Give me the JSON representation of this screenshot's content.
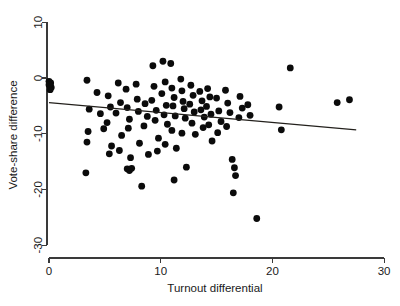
{
  "chart_data": {
    "type": "scatter",
    "title": "",
    "subtitle": "",
    "xlabel": "Turnout differential",
    "ylabel": "Vote-share difference",
    "xlim": [
      -1.2,
      31.0
    ],
    "ylim": [
      -31.5,
      11.5
    ],
    "xticks": [
      0,
      10,
      20,
      30
    ],
    "xticklabels": [
      "0",
      "10",
      "20",
      "30"
    ],
    "yticks": [
      10,
      0,
      -10,
      -20,
      -30
    ],
    "yticklabels": [
      "10",
      "0",
      "-10",
      "-20",
      "-30"
    ],
    "grid": false,
    "legend": null,
    "marker": {
      "shape": "circle",
      "color": "#0b0b0b",
      "size_px": 3.4
    },
    "series": [
      {
        "name": "observations",
        "points": [
          [
            0.0,
            -0.6
          ],
          [
            0.05,
            -1.0
          ],
          [
            0.1,
            -1.4
          ],
          [
            0.15,
            -0.9
          ],
          [
            0.2,
            -1.7
          ],
          [
            0.1,
            -2.1
          ],
          [
            0.0,
            -1.2
          ],
          [
            3.4,
            -0.4
          ],
          [
            3.6,
            -5.6
          ],
          [
            3.5,
            -9.6
          ],
          [
            3.4,
            -11.5
          ],
          [
            3.3,
            -17.0
          ],
          [
            4.3,
            -2.6
          ],
          [
            4.6,
            -6.4
          ],
          [
            4.9,
            -9.1
          ],
          [
            5.3,
            -3.2
          ],
          [
            5.5,
            -5.2
          ],
          [
            5.2,
            -8.0
          ],
          [
            5.6,
            -12.2
          ],
          [
            5.4,
            -13.6
          ],
          [
            6.2,
            -0.9
          ],
          [
            6.4,
            -4.4
          ],
          [
            6.0,
            -6.3
          ],
          [
            6.5,
            -10.3
          ],
          [
            6.3,
            -13.0
          ],
          [
            6.9,
            -2.0
          ],
          [
            7.0,
            -5.3
          ],
          [
            7.2,
            -7.4
          ],
          [
            7.1,
            -9.0
          ],
          [
            7.3,
            -14.3
          ],
          [
            7.0,
            -16.3
          ],
          [
            7.2,
            -16.6
          ],
          [
            7.4,
            -16.2
          ],
          [
            7.8,
            -1.1
          ],
          [
            7.9,
            -3.8
          ],
          [
            8.0,
            -6.0
          ],
          [
            8.1,
            -11.7
          ],
          [
            8.3,
            -19.4
          ],
          [
            8.6,
            -4.6
          ],
          [
            8.8,
            -6.9
          ],
          [
            8.5,
            -8.6
          ],
          [
            8.9,
            -13.7
          ],
          [
            9.3,
            2.2
          ],
          [
            9.4,
            -1.5
          ],
          [
            9.2,
            -4.0
          ],
          [
            9.6,
            -5.8
          ],
          [
            9.5,
            -7.6
          ],
          [
            9.8,
            -10.8
          ],
          [
            9.7,
            -13.1
          ],
          [
            10.2,
            3.0
          ],
          [
            10.4,
            -0.7
          ],
          [
            10.1,
            -2.8
          ],
          [
            10.5,
            -4.9
          ],
          [
            10.3,
            -6.6
          ],
          [
            10.6,
            -8.3
          ],
          [
            10.4,
            -11.9
          ],
          [
            10.9,
            2.6
          ],
          [
            11.0,
            -1.8
          ],
          [
            11.2,
            -3.5
          ],
          [
            11.1,
            -5.0
          ],
          [
            11.3,
            -6.8
          ],
          [
            11.0,
            -9.4
          ],
          [
            11.4,
            -12.6
          ],
          [
            11.2,
            -18.3
          ],
          [
            11.8,
            -0.2
          ],
          [
            11.9,
            -2.3
          ],
          [
            12.0,
            -4.2
          ],
          [
            12.1,
            -5.5
          ],
          [
            12.2,
            -7.2
          ],
          [
            11.9,
            -9.9
          ],
          [
            12.3,
            -16.0
          ],
          [
            12.7,
            -1.3
          ],
          [
            12.9,
            -3.1
          ],
          [
            12.6,
            -4.7
          ],
          [
            13.0,
            -6.1
          ],
          [
            12.8,
            -8.1
          ],
          [
            13.1,
            -10.1
          ],
          [
            13.5,
            -2.4
          ],
          [
            13.7,
            -4.1
          ],
          [
            13.6,
            -5.7
          ],
          [
            13.9,
            -7.0
          ],
          [
            13.8,
            -8.9
          ],
          [
            14.2,
            -1.9
          ],
          [
            14.4,
            -3.4
          ],
          [
            14.1,
            -5.1
          ],
          [
            14.5,
            -6.5
          ],
          [
            14.3,
            -8.4
          ],
          [
            14.6,
            -11.3
          ],
          [
            15.0,
            -3.6
          ],
          [
            15.2,
            -5.9
          ],
          [
            15.4,
            -7.8
          ],
          [
            15.1,
            -9.8
          ],
          [
            15.8,
            -2.2
          ],
          [
            16.0,
            -4.5
          ],
          [
            16.2,
            -6.2
          ],
          [
            15.9,
            -8.7
          ],
          [
            16.4,
            -14.6
          ],
          [
            16.6,
            -16.1
          ],
          [
            16.7,
            -17.5
          ],
          [
            16.5,
            -20.6
          ],
          [
            17.1,
            -3.3
          ],
          [
            17.3,
            -5.4
          ],
          [
            17.0,
            -7.1
          ],
          [
            17.8,
            -4.8
          ],
          [
            18.0,
            -6.7
          ],
          [
            18.6,
            -25.2
          ],
          [
            20.6,
            -5.2
          ],
          [
            20.8,
            -9.3
          ],
          [
            21.6,
            1.8
          ],
          [
            25.8,
            -4.4
          ],
          [
            26.9,
            -3.9
          ]
        ]
      }
    ],
    "fit_line": {
      "name": "regression-line",
      "x_start": 0.0,
      "y_start": -4.4,
      "x_end": 27.5,
      "y_end": -9.3,
      "color": "#23201c"
    }
  }
}
